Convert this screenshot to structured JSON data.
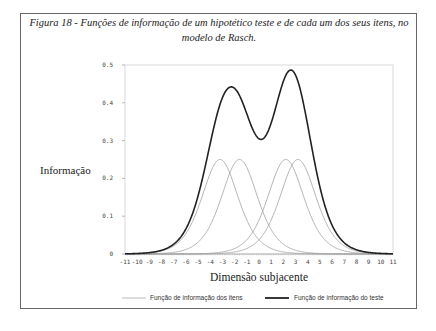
{
  "caption": "Figura 18 - Funções de informação de um hipotético teste e de cada um dos seus itens, no modelo de Rasch.",
  "chart_data": {
    "type": "line",
    "title": "Figura 18 - Funções de informação de um hipotético teste e de cada um dos seus itens, no modelo de Rasch.",
    "xlabel": "Dimensão subjacente",
    "ylabel": "Informação",
    "xlim": [
      -11,
      11
    ],
    "ylim": [
      0,
      0.5
    ],
    "xticks": [
      -11,
      -10,
      -9,
      -8,
      -7,
      -6,
      -5,
      -4,
      -3,
      -2,
      -1,
      0,
      1,
      2,
      3,
      4,
      5,
      6,
      7,
      8,
      9,
      10,
      11
    ],
    "yticks": [
      0,
      0.1,
      0.2,
      0.3,
      0.4,
      0.5
    ],
    "ytick_labels": [
      "0",
      "0.1",
      "0.2",
      "0.3",
      "0.4",
      "0.5"
    ],
    "grid": false,
    "legend_position": "bottom",
    "item_difficulties": [
      -3.2,
      -1.6,
      2.2,
      3.2
    ],
    "series": [
      {
        "name": "Função de informação dos itens",
        "style": "thin gray",
        "color": "#9a9a9a",
        "peak_values": [
          0.25,
          0.25,
          0.25,
          0.25
        ],
        "peak_x": [
          -3.2,
          -1.6,
          2.2,
          3.2
        ]
      },
      {
        "name": "Função de informação do teste",
        "style": "thick black",
        "color": "#222222",
        "peaks": [
          {
            "x": -2.4,
            "y": 0.42
          },
          {
            "x": 2.7,
            "y": 0.48
          }
        ],
        "trough": {
          "x": 0.2,
          "y": 0.33
        }
      }
    ]
  },
  "legend": {
    "items_label": "Função de informação dos itens",
    "test_label": "Função de informação do teste"
  }
}
